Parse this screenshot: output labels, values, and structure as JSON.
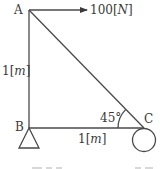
{
  "diagram": {
    "type": "truss-statics",
    "nodes": {
      "A": {
        "label": "A"
      },
      "B": {
        "label": "B"
      },
      "C": {
        "label": "C"
      }
    },
    "force": {
      "value": "100",
      "unit_open": "[",
      "unit": "N",
      "unit_close": "]",
      "direction": "right",
      "applied_at": "A"
    },
    "members": [
      {
        "from": "A",
        "to": "B"
      },
      {
        "from": "B",
        "to": "C"
      },
      {
        "from": "A",
        "to": "C"
      }
    ],
    "dimensions": {
      "AB": {
        "value": "1",
        "unit_open": "[",
        "unit": "m",
        "unit_close": "]"
      },
      "BC": {
        "value": "1",
        "unit_open": "[",
        "unit": "m",
        "unit_close": "]"
      }
    },
    "angle": {
      "value": "45°",
      "at": "C"
    },
    "supports": {
      "B": "pin-triangle",
      "C": "roller-circle"
    }
  }
}
